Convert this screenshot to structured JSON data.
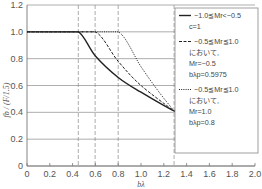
{
  "chart_data": {
    "type": "line",
    "title": "",
    "xlabel": "bλ",
    "ylabel": "fb / (F/1.5)",
    "xlim": [
      0,
      2.0
    ],
    "ylim": [
      0,
      1.2
    ],
    "x_ticks": [
      "0",
      "0.2",
      "0.4",
      "0.6",
      "0.8",
      "1.0",
      "1.2",
      "1.4",
      "1.6",
      "1.8",
      "2.0"
    ],
    "y_ticks": [
      "0",
      "0.2",
      "0.4",
      "0.6",
      "0.8",
      "1.0",
      "1.2"
    ],
    "grid": "horizontal",
    "legend_position": "upper right",
    "reference_lines_x": [
      0.45,
      0.5975,
      0.8,
      1.29
    ],
    "series": [
      {
        "name": "−1.0≦Mr<−0.5, c=1",
        "style": "solid",
        "x": [
          0,
          0.45,
          0.6,
          0.8,
          1.0,
          1.29,
          1.5,
          1.8,
          2.0
        ],
        "y": [
          1.0,
          1.0,
          0.82,
          0.66,
          0.55,
          0.41,
          0.34,
          0.28,
          0.25
        ]
      },
      {
        "name": "−0.5≦Mr≦1.0 において, Mr=−0.5, bλp=0.5975",
        "style": "dashed",
        "x": [
          0,
          0.5975,
          0.8,
          1.0,
          1.29
        ],
        "y": [
          1.0,
          1.0,
          0.78,
          0.6,
          0.41
        ]
      },
      {
        "name": "−0.5≦Mr≦1.0 において, Mr=1.0, bλp=0.8",
        "style": "dotted",
        "x": [
          0,
          0.8,
          1.0,
          1.15,
          1.29
        ],
        "y": [
          1.0,
          1.0,
          0.74,
          0.56,
          0.41
        ]
      }
    ]
  },
  "legend": {
    "items": [
      {
        "lines": [
          "−1.0≦Mr<−0.5",
          "c=1"
        ]
      },
      {
        "lines": [
          "−0.5≦Mr≦1.0",
          "において,",
          "Mr=−0.5",
          "bλp=0.5975"
        ]
      },
      {
        "lines": [
          "−0.5≦Mr≦1.0",
          "において,",
          "Mr=1.0",
          "bλp=0.8"
        ]
      }
    ]
  },
  "colors": {
    "line": "#222222",
    "grid": "#888888",
    "text": "#555555"
  }
}
